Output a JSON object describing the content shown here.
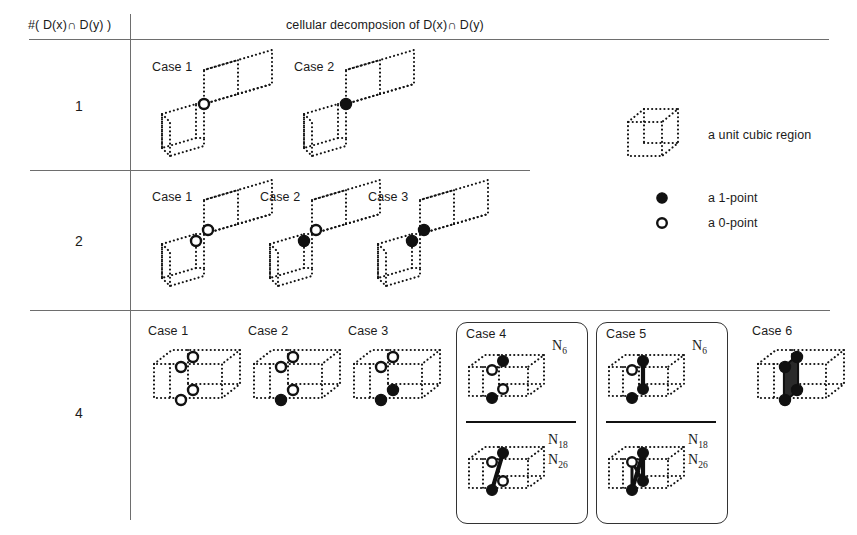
{
  "figure": {
    "header": {
      "left": "#( D(x)∩ D(y) )",
      "middle": "cellular decomposion of  D(x)∩ D(y)"
    },
    "rows": [
      {
        "count_label": "1",
        "cases": [
          {
            "label": "Case 1",
            "shape": "corner-pair",
            "points": [
              "0"
            ]
          },
          {
            "label": "Case 2",
            "shape": "corner-pair",
            "points": [
              "1"
            ]
          }
        ]
      },
      {
        "count_label": "2",
        "cases": [
          {
            "label": "Case 1",
            "shape": "corner-pair",
            "points": [
              "0",
              "0"
            ]
          },
          {
            "label": "Case 2",
            "shape": "corner-pair",
            "points": [
              "1",
              "0"
            ]
          },
          {
            "label": "Case 3",
            "shape": "corner-pair",
            "points": [
              "1",
              "1"
            ]
          }
        ]
      },
      {
        "count_label": "4",
        "cases": [
          {
            "label": "Case 1",
            "shape": "double-cube",
            "points": [
              "0",
              "0",
              "0",
              "0"
            ],
            "boxed": false
          },
          {
            "label": "Case 2",
            "shape": "double-cube",
            "points": [
              "0",
              "0",
              "0",
              "1"
            ],
            "boxed": false
          },
          {
            "label": "Case 3",
            "shape": "double-cube",
            "points": [
              "0",
              "0",
              "1",
              "1"
            ],
            "boxed": false
          },
          {
            "label": "Case 4",
            "shape": "double-cube",
            "boxed": true,
            "panels": [
              {
                "neighborhood": "N",
                "neighborhood_sub": "6",
                "connected": false
              },
              {
                "neighborhood": "N",
                "neighborhood_sub": "18",
                "neighborhood2": "N",
                "neighborhood2_sub": "26",
                "connected": true
              }
            ]
          },
          {
            "label": "Case 5",
            "shape": "double-cube",
            "boxed": true,
            "panels": [
              {
                "neighborhood": "N",
                "neighborhood_sub": "6",
                "connected": true
              },
              {
                "neighborhood": "N",
                "neighborhood_sub": "18",
                "neighborhood2": "N",
                "neighborhood2_sub": "26",
                "connected": true
              }
            ]
          },
          {
            "label": "Case 6",
            "shape": "double-cube",
            "points": [
              "1",
              "1",
              "1",
              "1"
            ],
            "boxed": false
          }
        ]
      }
    ],
    "legend": {
      "cube": {
        "caption": "a unit cubic region"
      },
      "one_point": {
        "caption": "a 1-point",
        "glyph": "filled-circle"
      },
      "zero_point": {
        "caption": "a 0-point",
        "glyph": "open-circle"
      }
    },
    "n_labels": {
      "n6": "N",
      "n6_sub": "6",
      "n18": "N",
      "n18_sub": "18",
      "n26": "N",
      "n26_sub": "26"
    }
  }
}
